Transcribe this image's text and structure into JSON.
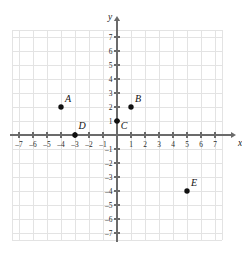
{
  "chart_data": {
    "type": "scatter",
    "title": "",
    "xlabel": "x",
    "ylabel": "y",
    "xlim": [
      -7.8,
      7.8
    ],
    "ylim": [
      -7.8,
      7.8
    ],
    "grid": true,
    "legend": "none",
    "x_ticks": [
      -7,
      -6,
      -5,
      -4,
      -3,
      -2,
      -1,
      1,
      2,
      3,
      4,
      5,
      6,
      7
    ],
    "y_ticks": [
      7,
      6,
      5,
      4,
      3,
      2,
      1,
      -1,
      -2,
      -3,
      -4,
      -5,
      -6,
      -7
    ],
    "x_tick_labels": [
      "–7",
      "–6",
      "–5",
      "–4",
      "–3",
      "–2",
      "–1",
      "1",
      "2",
      "3",
      "4",
      "5",
      "6",
      "7"
    ],
    "y_tick_labels": [
      "7",
      "6",
      "5",
      "4",
      "3",
      "2",
      "1",
      "–1",
      "–2",
      "–3",
      "–4",
      "–5",
      "–6",
      "–7"
    ],
    "points": [
      {
        "label": "A",
        "x": -4,
        "y": 2,
        "label_dx": 7,
        "label_dy": -5
      },
      {
        "label": "B",
        "x": 1,
        "y": 2,
        "label_dx": 7,
        "label_dy": -5
      },
      {
        "label": "C",
        "x": 0,
        "y": 1,
        "label_dx": 7,
        "label_dy": 8
      },
      {
        "label": "D",
        "x": -3,
        "y": 0,
        "label_dx": 7,
        "label_dy": -6
      },
      {
        "label": "E",
        "x": 5,
        "y": -4,
        "label_dx": 7,
        "label_dy": -5
      }
    ],
    "colors": {
      "grid": "#e3e3e3",
      "axis": "#6b6b6b",
      "point": "#111111",
      "text": "#1a1a1a",
      "background": "#ffffff"
    }
  },
  "axes": {
    "x_name": "x",
    "y_name": "y"
  }
}
